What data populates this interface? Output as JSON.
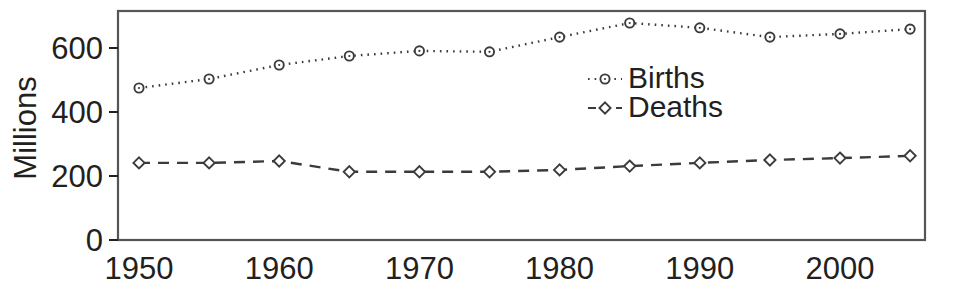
{
  "chart_data": {
    "type": "line",
    "title": "",
    "xlabel": "",
    "ylabel": "Millions",
    "x": [
      1950,
      1955,
      1960,
      1965,
      1970,
      1975,
      1980,
      1985,
      1990,
      1995,
      2000,
      2005
    ],
    "xlim": [
      1948,
      2007
    ],
    "ylim": [
      0,
      740
    ],
    "xticks": [
      1950,
      1960,
      1970,
      1980,
      1990,
      2000
    ],
    "xtick_labels": [
      "1950",
      "1960",
      "1970",
      "1980",
      "1990",
      "2000"
    ],
    "yticks": [
      0,
      200,
      400,
      600
    ],
    "ytick_labels": [
      "0",
      "200",
      "400",
      "600"
    ],
    "grid": false,
    "legend_position": "center",
    "series": [
      {
        "name": "Births",
        "marker": "circle",
        "linestyle": "dotted",
        "color": "#3b3b3b",
        "values": [
          475,
          503,
          547,
          575,
          591,
          588,
          634,
          678,
          663,
          634,
          644,
          659
        ]
      },
      {
        "name": "Deaths",
        "marker": "diamond",
        "linestyle": "dashed",
        "color": "#3b3b3b",
        "values": [
          241,
          241,
          247,
          213,
          213,
          213,
          219,
          231,
          241,
          250,
          256,
          263
        ]
      }
    ]
  },
  "legend": {
    "items": [
      {
        "label": "Births"
      },
      {
        "label": "Deaths"
      }
    ]
  },
  "axes": {
    "y_title": "Millions"
  },
  "colors": {
    "ink": "#231f20",
    "line": "#3b3b3b",
    "frame": "#555555",
    "background": "#ffffff"
  }
}
